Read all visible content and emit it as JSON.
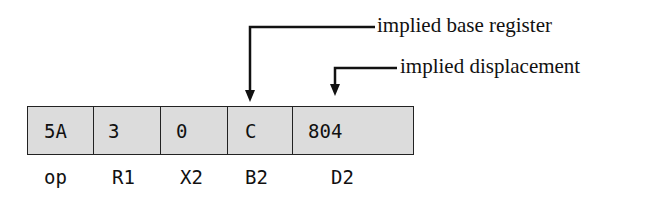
{
  "fields": [
    {
      "value": "5A",
      "label": "op"
    },
    {
      "value": "3",
      "label": "R1"
    },
    {
      "value": "0",
      "label": "X2"
    },
    {
      "value": "C",
      "label": "B2"
    },
    {
      "value": "804",
      "label": "D2"
    }
  ],
  "annotations": {
    "base": "implied base register",
    "disp": "implied displacement"
  }
}
